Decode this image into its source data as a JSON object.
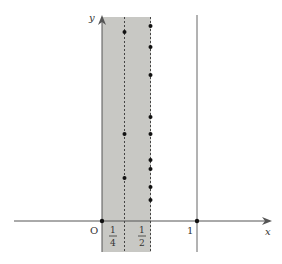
{
  "diagram": {
    "axes": {
      "x_label": "x",
      "y_label": "y",
      "origin_label": "O"
    },
    "ticks": [
      {
        "name": "quarter",
        "numerator": "1",
        "denominator": "4",
        "value": 0.25
      },
      {
        "name": "half",
        "numerator": "1",
        "denominator": "2",
        "value": 0.5
      },
      {
        "name": "one",
        "label": "1",
        "value": 1
      }
    ],
    "shaded_region": {
      "from": 0,
      "to": 0.5,
      "color": "#c8c8c4"
    },
    "vertical_lines": [
      {
        "x": 0.25,
        "style": "dashed"
      },
      {
        "x": 0.5,
        "style": "dashed"
      },
      {
        "x": 1,
        "style": "solid"
      }
    ],
    "points_on_quarter_line": [
      32,
      134,
      178
    ],
    "points_on_half_line": [
      26,
      47,
      75,
      117,
      134,
      160,
      169,
      187,
      200
    ],
    "colors": {
      "shade": "#c8c8c4",
      "axis": "#555555",
      "point": "#111111"
    }
  }
}
